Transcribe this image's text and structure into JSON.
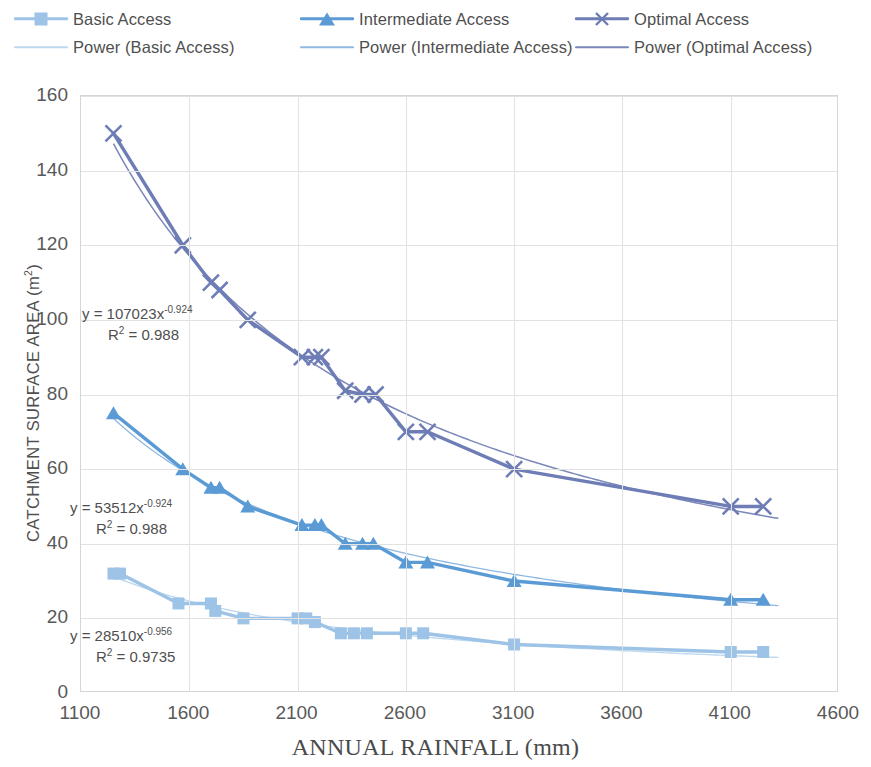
{
  "legend": {
    "entries": [
      {
        "label": "Basic Access",
        "marker": "square-marker",
        "color": "#9DC3E6",
        "style": "series"
      },
      {
        "label": "Intermediate Access",
        "marker": "triangle-marker",
        "color": "#5B9BD5",
        "style": "series"
      },
      {
        "label": "Optimal Access",
        "marker": "x-marker",
        "color": "#6E7DB5",
        "style": "series"
      },
      {
        "label": "Power (Basic Access)",
        "marker": "line-marker",
        "color": "#BDD7EE",
        "style": "trend"
      },
      {
        "label": "Power (Intermediate Access)",
        "marker": "line-marker",
        "color": "#8FB8E0",
        "style": "trend"
      },
      {
        "label": "Power (Optimal Access)",
        "marker": "line-marker",
        "color": "#7B87B8",
        "style": "trend"
      }
    ]
  },
  "annotations": [
    {
      "name": "optimal-equation",
      "line1": "y = 107023x",
      "exp": "-0.924",
      "line2_pre": "R",
      "line2_sup": "2",
      "line2_post": " = 0.988"
    },
    {
      "name": "intermediate-equation",
      "line1": "y = 53512x",
      "exp": "-0.924",
      "line2_pre": "R",
      "line2_sup": "2",
      "line2_post": " = 0.988"
    },
    {
      "name": "basic-equation",
      "line1": "y = 28510x",
      "exp": "-0.956",
      "line2_pre": "R",
      "line2_sup": "2",
      "line2_post": " = 0.9735"
    }
  ],
  "chart_data": {
    "type": "scatter",
    "title": "",
    "xlabel": "ANNUAL RAINFALL (mm)",
    "ylabel": "CATCHMENT SURFACE AREA (m",
    "ylabel_sup": "2",
    "ylabel_close": ")",
    "xlim": [
      1100,
      4600
    ],
    "ylim": [
      0,
      160
    ],
    "xticks": [
      1100,
      1600,
      2100,
      2600,
      3100,
      3600,
      4100,
      4600
    ],
    "yticks": [
      0,
      20,
      40,
      60,
      80,
      100,
      120,
      140,
      160
    ],
    "grid": true,
    "legend_position": "top",
    "series": [
      {
        "name": "Basic Access",
        "color": "#9DC3E6",
        "marker": "square",
        "trend_color": "#BDD7EE",
        "trend": {
          "a": 28510,
          "b": -0.956,
          "r2": 0.9735
        },
        "points": [
          {
            "x": 1250,
            "y": 32
          },
          {
            "x": 1280,
            "y": 32
          },
          {
            "x": 1550,
            "y": 24
          },
          {
            "x": 1700,
            "y": 24
          },
          {
            "x": 1720,
            "y": 22
          },
          {
            "x": 1850,
            "y": 20
          },
          {
            "x": 2100,
            "y": 20
          },
          {
            "x": 2140,
            "y": 20
          },
          {
            "x": 2180,
            "y": 19
          },
          {
            "x": 2300,
            "y": 16
          },
          {
            "x": 2360,
            "y": 16
          },
          {
            "x": 2420,
            "y": 16
          },
          {
            "x": 2600,
            "y": 16
          },
          {
            "x": 2680,
            "y": 16
          },
          {
            "x": 3100,
            "y": 13
          },
          {
            "x": 4100,
            "y": 11
          },
          {
            "x": 4250,
            "y": 11
          }
        ]
      },
      {
        "name": "Intermediate Access",
        "color": "#5B9BD5",
        "marker": "triangle",
        "trend_color": "#8FB8E0",
        "trend": {
          "a": 53512,
          "b": -0.924,
          "r2": 0.988
        },
        "points": [
          {
            "x": 1250,
            "y": 75
          },
          {
            "x": 1570,
            "y": 60
          },
          {
            "x": 1700,
            "y": 55
          },
          {
            "x": 1740,
            "y": 55
          },
          {
            "x": 1870,
            "y": 50
          },
          {
            "x": 2120,
            "y": 45
          },
          {
            "x": 2180,
            "y": 45
          },
          {
            "x": 2210,
            "y": 45
          },
          {
            "x": 2320,
            "y": 40
          },
          {
            "x": 2400,
            "y": 40
          },
          {
            "x": 2450,
            "y": 40
          },
          {
            "x": 2600,
            "y": 35
          },
          {
            "x": 2700,
            "y": 35
          },
          {
            "x": 3100,
            "y": 30
          },
          {
            "x": 4100,
            "y": 25
          },
          {
            "x": 4250,
            "y": 25
          }
        ]
      },
      {
        "name": "Optimal Access",
        "color": "#6E7DB5",
        "marker": "x",
        "trend_color": "#7B87B8",
        "trend": {
          "a": 107023,
          "b": -0.924,
          "r2": 0.988
        },
        "points": [
          {
            "x": 1250,
            "y": 150
          },
          {
            "x": 1570,
            "y": 120
          },
          {
            "x": 1700,
            "y": 110
          },
          {
            "x": 1740,
            "y": 108
          },
          {
            "x": 1870,
            "y": 100
          },
          {
            "x": 2120,
            "y": 90
          },
          {
            "x": 2180,
            "y": 90
          },
          {
            "x": 2210,
            "y": 90
          },
          {
            "x": 2320,
            "y": 81
          },
          {
            "x": 2400,
            "y": 80
          },
          {
            "x": 2460,
            "y": 80
          },
          {
            "x": 2600,
            "y": 70
          },
          {
            "x": 2700,
            "y": 70
          },
          {
            "x": 3100,
            "y": 60
          },
          {
            "x": 4100,
            "y": 50
          },
          {
            "x": 4250,
            "y": 50
          }
        ]
      }
    ]
  }
}
